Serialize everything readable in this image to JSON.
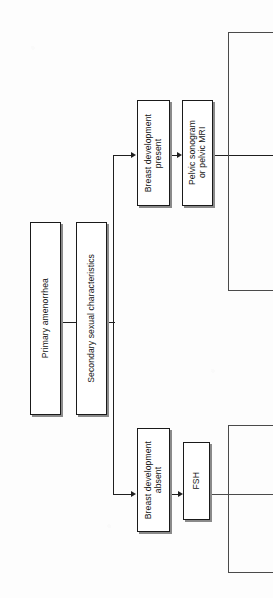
{
  "diagram": {
    "orientation": "rotated-90-ccw",
    "ink_color": "#1f1f1f",
    "box_fill": "#ffffff",
    "shadow_color": "#8a8a8a"
  },
  "nodes": [
    {
      "id": "primary-amenorrhea",
      "label": "Primary amenorrhea",
      "x": 30,
      "y": 222,
      "w": 31,
      "h": 193
    },
    {
      "id": "secondary-sexual-characteristics",
      "label": "Secondary sexual characteristics",
      "x": 76,
      "y": 222,
      "w": 31,
      "h": 193
    },
    {
      "id": "breast-development-present",
      "label": "Breast development\npresent",
      "x": 137,
      "y": 100,
      "w": 33,
      "h": 106
    },
    {
      "id": "pelvic-sonogram-or-mri",
      "label": "Pelvic sonogram\nor pelvic MRI",
      "x": 182,
      "y": 100,
      "w": 31,
      "h": 106
    },
    {
      "id": "breast-development-absent",
      "label": "Breast development\nabsent",
      "x": 137,
      "y": 428,
      "w": 33,
      "h": 104
    },
    {
      "id": "fsh",
      "label": "FSH",
      "x": 183,
      "y": 442,
      "w": 27,
      "h": 78
    }
  ],
  "connectors": [
    {
      "id": "primary-to-secondary",
      "type": "elbow"
    },
    {
      "id": "secondary-to-breast-present",
      "type": "elbow-arrow"
    },
    {
      "id": "secondary-to-breast-absent",
      "type": "elbow-arrow"
    },
    {
      "id": "breast-present-to-sonogram",
      "type": "arrow"
    },
    {
      "id": "breast-absent-to-fsh",
      "type": "arrow"
    },
    {
      "id": "sonogram-branch-fork",
      "type": "fork"
    },
    {
      "id": "fsh-branch-fork",
      "type": "fork"
    }
  ]
}
